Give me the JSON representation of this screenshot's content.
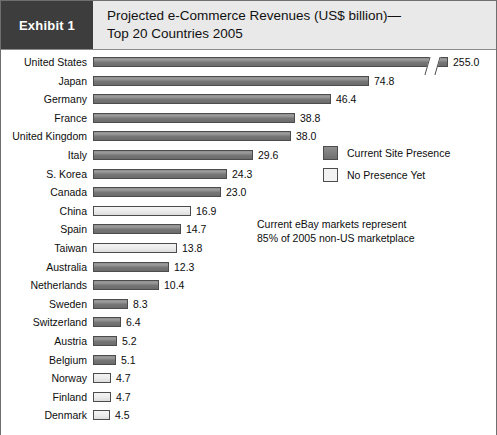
{
  "header": {
    "exhibit_tag": "Exhibit 1",
    "title_line1": "Projected e-Commerce Revenues (US$ billion)—",
    "title_line2": "Top 20 Countries 2005"
  },
  "legend": {
    "items": [
      {
        "label": "Current Site Presence",
        "style": "dark",
        "swatch_color": "#7d7d7d"
      },
      {
        "label": "No Presence Yet",
        "style": "light",
        "swatch_color": "#f2f2f2"
      }
    ]
  },
  "annotation": {
    "line1": "Current eBay markets represent",
    "line2": "85% of 2005 non-US marketplace"
  },
  "colors": {
    "tag_background": "#3d3d3d",
    "header_background": "#e9e9e9",
    "border": "#6f6f6f",
    "bar_dark": "#7d7d7d",
    "bar_light": "#f2f2f2",
    "bar_outline": "#4c4c4c",
    "text": "#0d0d0d"
  },
  "chart_data": {
    "type": "bar",
    "orientation": "horizontal",
    "xlabel": "",
    "ylabel": "",
    "unit": "US$ billion",
    "value_axis_broken": true,
    "axis_break_note": "United States bar is truncated with a break symbol",
    "grid": false,
    "legend_position": "right",
    "categories": [
      "United States",
      "Japan",
      "Germany",
      "France",
      "United Kingdom",
      "Italy",
      "S. Korea",
      "Canada",
      "China",
      "Spain",
      "Taiwan",
      "Australia",
      "Netherlands",
      "Sweden",
      "Switzerland",
      "Austria",
      "Belgium",
      "Norway",
      "Finland",
      "Denmark"
    ],
    "values": [
      255.0,
      74.8,
      46.4,
      38.8,
      38.0,
      29.6,
      24.3,
      23.0,
      16.9,
      14.7,
      13.8,
      12.3,
      10.4,
      8.3,
      6.4,
      5.2,
      5.1,
      4.7,
      4.7,
      4.5
    ],
    "value_labels": [
      "255.0",
      "74.8",
      "46.4",
      "38.8",
      "38.0",
      "29.6",
      "24.3",
      "23.0",
      "16.9",
      "14.7",
      "13.8",
      "12.3",
      "10.4",
      "8.3",
      "6.4",
      "5.2",
      "5.1",
      "4.7",
      "4.7",
      "4.5"
    ],
    "series_groups": [
      "dark",
      "dark",
      "dark",
      "dark",
      "dark",
      "dark",
      "dark",
      "dark",
      "light",
      "dark",
      "light",
      "dark",
      "dark",
      "dark",
      "dark",
      "dark",
      "dark",
      "light",
      "light",
      "light"
    ],
    "series": [
      {
        "name": "Current Site Presence",
        "style": "dark"
      },
      {
        "name": "No Presence Yet",
        "style": "light"
      }
    ],
    "bar_pixel_widths": [
      355,
      276,
      238,
      202,
      198,
      160,
      134,
      128,
      98,
      88,
      84,
      76,
      66,
      35,
      28,
      24,
      23,
      18,
      18,
      17
    ]
  }
}
